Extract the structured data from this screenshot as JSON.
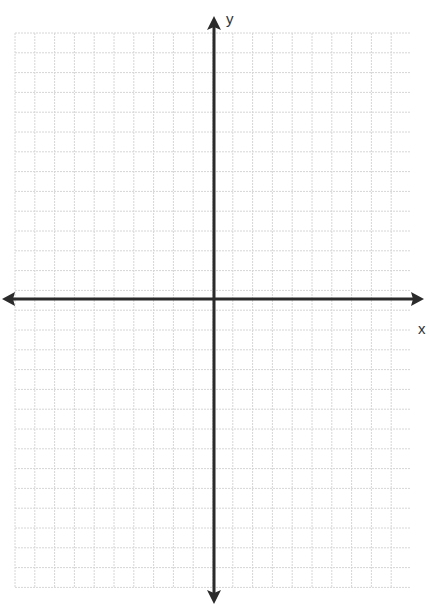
{
  "diagram": {
    "type": "coordinate-plane",
    "x_axis_label": "x",
    "y_axis_label": "y",
    "grid": {
      "left": 15,
      "top": 33,
      "right": 410,
      "bottom": 588,
      "cell_size": 19.8,
      "line_color": "#d6d6d6"
    },
    "axes": {
      "origin_x": 214,
      "origin_y": 299,
      "color": "#2b2b2b",
      "thickness": 3
    }
  }
}
